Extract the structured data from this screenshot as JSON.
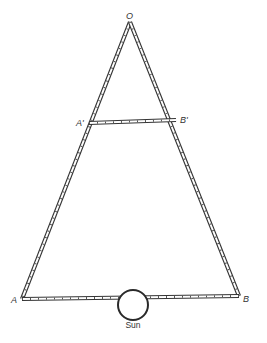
{
  "diagram": {
    "type": "triangle-measuring-rods",
    "points": {
      "O": {
        "label": "O",
        "x": 130,
        "y": 22
      },
      "A1": {
        "label": "A'",
        "x": 89,
        "y": 123
      },
      "B1": {
        "label": "B'",
        "x": 176,
        "y": 120
      },
      "A": {
        "label": "A",
        "x": 22,
        "y": 299
      },
      "B": {
        "label": "B",
        "x": 239,
        "y": 296
      }
    },
    "rods": [
      {
        "from": "O",
        "to": "A"
      },
      {
        "from": "O",
        "to": "B"
      },
      {
        "from": "A1",
        "to": "B1"
      },
      {
        "from": "A",
        "to": "B"
      }
    ],
    "sun": {
      "label": "Sun",
      "cx": 133,
      "cy": 305,
      "r": 15
    },
    "colors": {
      "ink": "#333333",
      "background": "#ffffff"
    }
  }
}
